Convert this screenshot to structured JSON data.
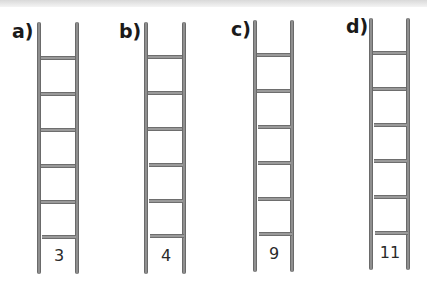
{
  "ladders": [
    {
      "label": "a)",
      "number": "3"
    },
    {
      "label": "b)",
      "number": "4"
    },
    {
      "label": "c)",
      "number": "9"
    },
    {
      "label": "d)",
      "number": "11"
    }
  ],
  "rungs_per_ladder": 6,
  "colors": {
    "rail": "#8f8f8f",
    "rung": "#9a9a9a",
    "text": "#1a1a1a"
  }
}
